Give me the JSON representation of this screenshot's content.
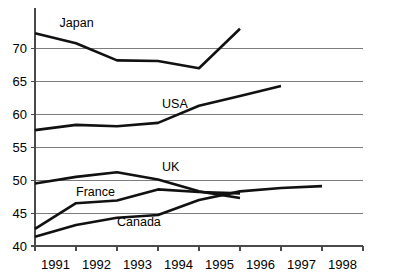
{
  "chart_data": {
    "type": "line",
    "title": "",
    "subtitle": "",
    "xlabel": "",
    "ylabel": "",
    "categories": [
      "1991",
      "1992",
      "1993",
      "1994",
      "1995",
      "1996",
      "1997",
      "1998"
    ],
    "x": [
      1991,
      1992,
      1993,
      1994,
      1995,
      1996,
      1997,
      1998
    ],
    "xlim": [
      1990.5,
      1998.5
    ],
    "ylim": [
      40,
      75
    ],
    "y_ticks": [
      40,
      45,
      50,
      55,
      60,
      65,
      70
    ],
    "y_tick_labels": [
      "40",
      "45",
      "50",
      "55",
      "60",
      "65",
      "70"
    ],
    "grid": "horizontal",
    "legend": "inline-labels",
    "legend_position": "on-plot",
    "series": [
      {
        "name": "Japan",
        "label": "Japan",
        "x": [
          1991,
          1992,
          1993,
          1994,
          1995,
          1996
        ],
        "values": [
          72.3,
          70.8,
          68.2,
          68.1,
          67.0,
          73.0
        ],
        "label_x": 1991.6,
        "label_y": 73.3
      },
      {
        "name": "USA",
        "label": "USA",
        "x": [
          1991,
          1992,
          1993,
          1994,
          1995,
          1996,
          1997
        ],
        "values": [
          57.6,
          58.4,
          58.2,
          58.7,
          61.3,
          62.8,
          64.3
        ],
        "label_x": 1994.1,
        "label_y": 61.0
      },
      {
        "name": "UK",
        "label": "UK",
        "x": [
          1991,
          1992,
          1993,
          1994,
          1995,
          1996
        ],
        "values": [
          49.5,
          50.5,
          51.2,
          50.1,
          48.3,
          47.3
        ],
        "label_x": 1994.1,
        "label_y": 51.4
      },
      {
        "name": "France",
        "label": "France",
        "x": [
          1991,
          1992,
          1993,
          1994,
          1995,
          1996
        ],
        "values": [
          42.6,
          46.5,
          46.9,
          48.6,
          48.2,
          48.0
        ],
        "label_x": 1992.0,
        "label_y": 47.6
      },
      {
        "name": "Canada",
        "label": "Canada",
        "x": [
          1991,
          1992,
          1993,
          1994,
          1995,
          1996,
          1997,
          1998
        ],
        "values": [
          41.4,
          43.2,
          44.3,
          44.7,
          47.0,
          48.3,
          48.8,
          49.1
        ],
        "label_x": 1993.0,
        "label_y": 43.0
      }
    ],
    "colors": {
      "series_stroke": "#111111",
      "gridline": "#6f6f6f",
      "axis": "#4a4a4a",
      "background": "#ffffff",
      "text": "#000000"
    }
  }
}
